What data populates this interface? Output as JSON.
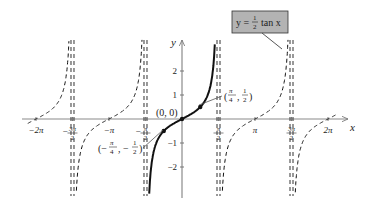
{
  "chart_data": {
    "type": "line",
    "function": "y = (1/2) tan x",
    "xlabel": "x",
    "ylabel": "y",
    "xlim": [
      -6.6,
      7.2
    ],
    "ylim": [
      -3.2,
      3.3
    ],
    "x_ticks": [
      {
        "value": -6.2832,
        "label": "−2π"
      },
      {
        "value": -4.7124,
        "label": "−3π/2"
      },
      {
        "value": -3.1416,
        "label": "−π"
      },
      {
        "value": -1.5708,
        "label": "−π/2"
      },
      {
        "value": 1.5708,
        "label": "π/2"
      },
      {
        "value": 3.1416,
        "label": "π"
      },
      {
        "value": 4.7124,
        "label": "3π/2"
      },
      {
        "value": 6.2832,
        "label": "2π"
      }
    ],
    "y_ticks": [
      {
        "value": 2,
        "label": "2"
      },
      {
        "value": 1,
        "label": "1"
      },
      {
        "value": -1,
        "label": "−1"
      },
      {
        "value": -2,
        "label": "−2"
      }
    ],
    "asymptotes": [
      -4.7124,
      -1.5708,
      1.5708,
      4.7124
    ],
    "series": [
      {
        "name": "principal branch",
        "style": "solid",
        "domain": [
          -1.5708,
          1.5708
        ]
      },
      {
        "name": "other branches",
        "style": "dashed",
        "domains": [
          [
            -6.6,
            -4.7124
          ],
          [
            -4.7124,
            -1.5708
          ],
          [
            1.5708,
            4.7124
          ],
          [
            4.7124,
            7.2
          ]
        ]
      }
    ],
    "points": [
      {
        "x": 0,
        "y": 0,
        "label": "(0, 0)"
      },
      {
        "x": 0.7854,
        "y": 0.5,
        "label": "(π/4, 1/2)"
      },
      {
        "x": -0.7854,
        "y": -0.5,
        "label": "(−π/4, −1/2)"
      }
    ],
    "legend": {
      "text": "y = ½ tan x",
      "fill": "#b3b3b3"
    },
    "grid": false
  },
  "labels": {
    "x_axis": "x",
    "y_axis": "y",
    "origin": "(0, 0)",
    "legend_lhs": "y =",
    "legend_num": "1",
    "legend_den": "2",
    "legend_rhs": "tan x"
  }
}
